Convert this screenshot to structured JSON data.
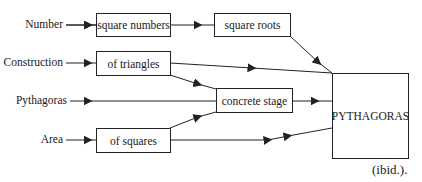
{
  "diagram": {
    "inputs": [
      {
        "id": "number",
        "label": "Number"
      },
      {
        "id": "construction",
        "label": "Construction"
      },
      {
        "id": "pythagoras",
        "label": "Pythagoras"
      },
      {
        "id": "area",
        "label": "Area"
      }
    ],
    "nodes": {
      "square_numbers": "square numbers",
      "square_roots": "square roots",
      "of_triangles": "of triangles",
      "concrete_stage": "concrete stage",
      "of_squares": "of squares",
      "pythagoras_box": "PYTHAGORAS"
    },
    "edges": [
      {
        "from": "Number",
        "to": "square numbers"
      },
      {
        "from": "square numbers",
        "to": "square roots"
      },
      {
        "from": "square roots",
        "to": "PYTHAGORAS"
      },
      {
        "from": "Construction",
        "to": "of triangles"
      },
      {
        "from": "of triangles",
        "to": "PYTHAGORAS"
      },
      {
        "from": "of triangles",
        "to": "concrete stage"
      },
      {
        "from": "Pythagoras",
        "to": "concrete stage"
      },
      {
        "from": "concrete stage",
        "to": "PYTHAGORAS"
      },
      {
        "from": "Area",
        "to": "of squares"
      },
      {
        "from": "of squares",
        "to": "concrete stage"
      },
      {
        "from": "of squares",
        "to": "PYTHAGORAS"
      }
    ],
    "line_color": "#222222"
  },
  "citation": "(ibid.)."
}
